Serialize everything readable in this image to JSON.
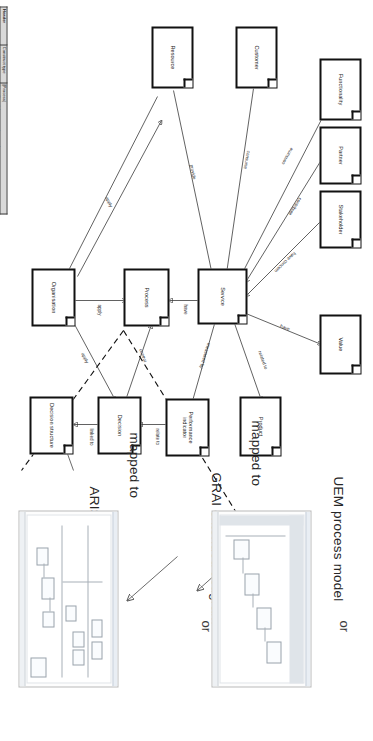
{
  "figure": {
    "orientation_note": "rotated-90",
    "concept_model": {
      "title": "Service concept model",
      "entities": [
        {
          "id": "functionality",
          "label": "Functionality"
        },
        {
          "id": "partner",
          "label": "Partner"
        },
        {
          "id": "stakeholder",
          "label": "Stakeholder"
        },
        {
          "id": "value",
          "label": "Value"
        },
        {
          "id": "customer",
          "label": "Customer"
        },
        {
          "id": "product",
          "label": "Product"
        },
        {
          "id": "service",
          "label": "Service"
        },
        {
          "id": "resource",
          "label": "Resource"
        },
        {
          "id": "performance_indicator",
          "label": "Performance indicator"
        },
        {
          "id": "process",
          "label": "Process"
        },
        {
          "id": "decision",
          "label": "Decision"
        },
        {
          "id": "organisation",
          "label": "Organisation"
        },
        {
          "id": "decision_structure",
          "label": "Decision structure"
        }
      ],
      "relations": [
        {
          "from": "service",
          "to": "functionality",
          "label": "consume"
        },
        {
          "from": "partner",
          "to": "service",
          "label": "contribute"
        },
        {
          "from": "stakeholder",
          "to": "service",
          "label": "have concern"
        },
        {
          "from": "service",
          "to": "value",
          "label": "have"
        },
        {
          "from": "customer",
          "to": "service",
          "label": "consume"
        },
        {
          "from": "service",
          "to": "product",
          "label": "related to"
        },
        {
          "from": "resource",
          "to": "service",
          "label": "provide"
        },
        {
          "from": "service",
          "to": "performance_indicator",
          "label": "measured by"
        },
        {
          "from": "service",
          "to": "process",
          "label": "have"
        },
        {
          "from": "performance_indicator",
          "to": "decision",
          "label": "relate to"
        },
        {
          "from": "decision",
          "to": "process",
          "label": "control"
        },
        {
          "from": "organisation",
          "to": "process",
          "label": "apply"
        },
        {
          "from": "organisation",
          "to": "decision",
          "label": "apply"
        },
        {
          "from": "organisation",
          "to": "service",
          "label": "apply"
        },
        {
          "from": "decision",
          "to": "decision_structure",
          "label": "linked to"
        }
      ]
    },
    "mappings": [
      {
        "id": "map1",
        "label": "UEM process model"
      },
      {
        "id": "map2",
        "label": "GRAI extended actigram"
      },
      {
        "id": "map3",
        "label": "ARIS process model"
      }
    ],
    "mapped_to_label": "mapped to",
    "or_label": "or",
    "or_more_label": "or ...",
    "thumbnails": [
      {
        "id": "thumb-uem",
        "caption": "UEM process model"
      },
      {
        "id": "thumb-grai",
        "caption": "GRAI extended actigram"
      },
      {
        "id": "thumb-aris",
        "caption": "ARIS process model"
      }
    ]
  },
  "template_table": {
    "columns": [
      "",
      "Construct type",
      "Process"
    ],
    "rows": [
      {
        "section": "Header",
        "field": "Construct type",
        "value": "[Process]",
        "section_cell": true,
        "shaded": true
      },
      {
        "section": "",
        "field": "Identifier",
        "value": "[Identifier of the process instance]"
      },
      {
        "section": "",
        "field": "Name",
        "value": "[Name of the process instance]"
      },
      {
        "section": "Body",
        "field": "Objective",
        "value": "[Short description of the process objective]",
        "section_cell": true,
        "shaded": true
      },
      {
        "section": "",
        "field": "Sub-process",
        "value": "[List of sub-processes or activities that compose this process instance]"
      },
      {
        "section": "",
        "field": "Trigger",
        "value": "[Condition this process instance is triggered]"
      },
      {
        "section": "",
        "field": "Result",
        "value": "[Output of this process instance]"
      },
      {
        "section": "",
        "field": "Constraint",
        "value": "[Constraint that may apply on this process instance]"
      },
      {
        "section": "Relationships to other model elements",
        "field": "SERVICE",
        "value": "[Identifier/name of service concerned by the template]",
        "section_cell": true,
        "shaded": true
      },
      {
        "section": "",
        "field": "RESOURCE",
        "value": "[Identifier/name of resources used by the process described by the template]"
      },
      {
        "section": "",
        "field": "Other Relationships",
        "value": "",
        "bold": true
      },
      {
        "section": "",
        "field": "RELATED TO MODEL LEVEL",
        "value": "Refer to CIM, PIM, PSM modelling level | CIM"
      },
      {
        "section": "",
        "field": "RELATED TO SLM PHASE",
        "value": "Refer to service lifecycle phases | Requirement"
      }
    ]
  }
}
